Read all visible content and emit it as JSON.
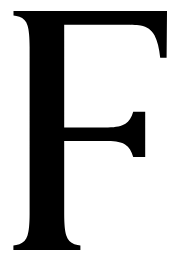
{
  "image": {
    "type": "letterform-glyph",
    "character": "F",
    "script": "Latin",
    "case": "uppercase",
    "typeface_style": "serif",
    "rendering": "solid fill, no outline",
    "background_color": "#ffffff",
    "glyph_color": "#000000",
    "width_px": 173,
    "height_px": 258
  },
  "glyph": {
    "label": "F",
    "description": "Capital letter F in a serif typeface",
    "features": {
      "stem": "vertical, bracketed serifs at top and bottom, slight concave taper",
      "top_arm": "horizontal bar with vertical right edge and concave beak spur descending on the right",
      "middle_arm": "shorter horizontal bar ending in a flared triangular wedge serif",
      "foot": "flared bracketed horizontal base serif"
    },
    "metrics": {
      "stem_left_x": 26,
      "stem_right_x": 64,
      "cap_top_y": 11,
      "baseline_y": 250,
      "top_bar_bottom_y": 26,
      "top_arm_right_x": 167,
      "top_arm_spur_bottom_y": 58,
      "middle_arm_top_y": 127,
      "middle_arm_bottom_y": 141,
      "middle_arm_right_x": 145,
      "foot_left_x": 13,
      "foot_right_x": 80
    }
  }
}
